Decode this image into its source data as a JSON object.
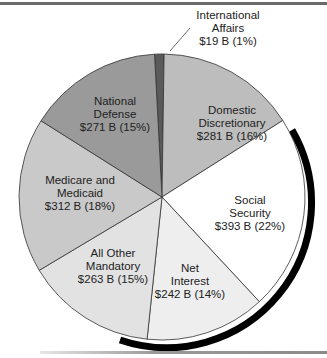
{
  "chart_data": {
    "type": "pie",
    "title": "",
    "unit": "Billions of dollars",
    "categories": [
      "International Affairs",
      "Domestic Discretionary",
      "Social Security",
      "Net Interest",
      "All Other Mandatory",
      "Medicare and Medicaid",
      "National Defense"
    ],
    "values": [
      19,
      281,
      393,
      242,
      263,
      312,
      271
    ],
    "percents": [
      1,
      16,
      22,
      14,
      15,
      18,
      15
    ],
    "colors": [
      "#5a5a5a",
      "#bdbdbd",
      "#ffffff",
      "#eeeeee",
      "#e2e2e2",
      "#c9c9c9",
      "#9a9a9a"
    ],
    "legend": "none (direct labels)"
  },
  "labels": [
    {
      "name": "International Affairs",
      "line1": "International",
      "line2": "Affairs",
      "value": "$19 B (1%)"
    },
    {
      "name": "Domestic Discretionary",
      "line1": "Domestic",
      "line2": "Discretionary",
      "value": "$281 B (16%)"
    },
    {
      "name": "Social Security",
      "line1": "Social",
      "line2": "Security",
      "value": "$393 B (22%)"
    },
    {
      "name": "Net Interest",
      "line1": "Net",
      "line2": "Interest",
      "value": "$242 B (14%)"
    },
    {
      "name": "All Other Mandatory",
      "line1": "All Other",
      "line2": "Mandatory",
      "value": "$263 B (15%)"
    },
    {
      "name": "Medicare and Medicaid",
      "line1": "Medicare and",
      "line2": "Medicaid",
      "value": "$312 B (18%)"
    },
    {
      "name": "National Defense",
      "line1": "National",
      "line2": "Defense",
      "value": "$271 B (15%)"
    }
  ]
}
